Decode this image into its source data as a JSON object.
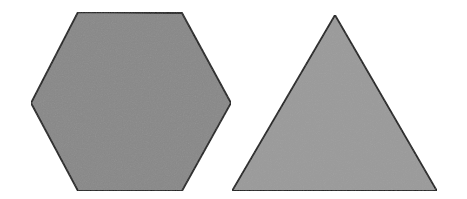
{
  "scene": {
    "title": "Two gray geometric shapes on white background",
    "width": 467,
    "height": 199,
    "background_color": "#ffffff",
    "stroke_color": "#1a1a1a",
    "stroke_width": 1.8,
    "shape_count": 2
  },
  "shapes": [
    {
      "id": "hexagon",
      "name": "hexagon",
      "label": "Hexagon",
      "sides": 6,
      "fill_color": "#888888",
      "stroke_color": "#1a1a1a",
      "stroke_width": 1.8,
      "position": "left",
      "points": "78,12 182,13 231,103 182,191 78,191 31,103",
      "bounds": {
        "x": 31,
        "y": 12,
        "width": 200,
        "height": 179
      },
      "center": {
        "x": 131,
        "y": 102
      }
    },
    {
      "id": "triangle",
      "name": "triangle",
      "label": "Triangle",
      "sides": 3,
      "fill_color": "#9a9a9a",
      "stroke_color": "#1a1a1a",
      "stroke_width": 1.8,
      "position": "right",
      "points": "335,15 437,191 232,191",
      "bounds": {
        "x": 232,
        "y": 15,
        "width": 205,
        "height": 176
      },
      "center": {
        "x": 335,
        "y": 132
      }
    }
  ],
  "texture": {
    "grain_opacity": 0.05,
    "grain_size": 3
  }
}
